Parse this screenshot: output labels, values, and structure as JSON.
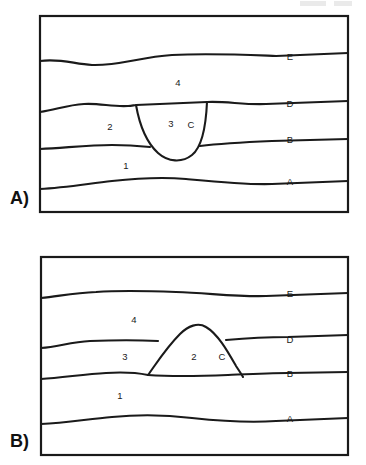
{
  "figure": {
    "background_color": "#ffffff",
    "line_color": "#1a1a1a",
    "panel_count": 2
  },
  "panels": [
    {
      "id": "panel-a",
      "label": "A)",
      "box": {
        "x": 40,
        "y": 16,
        "width": 308,
        "height": 196
      },
      "intrusion_shape": "downward-pointing U (sill/dike cutting down)",
      "rock_units": [
        {
          "name": "4",
          "x": 178,
          "y": 83
        },
        {
          "name": "2",
          "x": 110,
          "y": 127
        },
        {
          "name": "3",
          "x": 171,
          "y": 124
        },
        {
          "name": "1",
          "x": 126,
          "y": 166
        }
      ],
      "contacts": [
        {
          "name": "E",
          "x": 290,
          "y": 57
        },
        {
          "name": "D",
          "x": 290,
          "y": 104
        },
        {
          "name": "C",
          "x": 191,
          "y": 125
        },
        {
          "name": "B",
          "x": 290,
          "y": 140
        },
        {
          "name": "A",
          "x": 290,
          "y": 182
        }
      ]
    },
    {
      "id": "panel-b",
      "label": "B)",
      "box": {
        "x": 41,
        "y": 257,
        "width": 307,
        "height": 198
      },
      "intrusion_shape": "upward dome (laccolith / anticlinal intrusion)",
      "rock_units": [
        {
          "name": "4",
          "x": 134,
          "y": 320
        },
        {
          "name": "3",
          "x": 125,
          "y": 357
        },
        {
          "name": "2",
          "x": 194,
          "y": 357
        },
        {
          "name": "1",
          "x": 120,
          "y": 396
        }
      ],
      "contacts": [
        {
          "name": "E",
          "x": 290,
          "y": 294
        },
        {
          "name": "D",
          "x": 290,
          "y": 340
        },
        {
          "name": "C",
          "x": 222,
          "y": 357
        },
        {
          "name": "B",
          "x": 290,
          "y": 374
        },
        {
          "name": "A",
          "x": 290,
          "y": 419
        }
      ]
    }
  ]
}
